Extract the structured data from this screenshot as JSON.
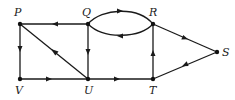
{
  "diagram": {
    "type": "directed-graph",
    "nodes": [
      {
        "id": "P",
        "label": "P",
        "x": 20,
        "y": 24,
        "lx": 14,
        "ly": 16
      },
      {
        "id": "Q",
        "label": "Q",
        "x": 88,
        "y": 24,
        "lx": 82,
        "ly": 16
      },
      {
        "id": "R",
        "label": "R",
        "x": 153,
        "y": 24,
        "lx": 149,
        "ly": 16
      },
      {
        "id": "S",
        "label": "S",
        "x": 217,
        "y": 52,
        "lx": 222,
        "ly": 56
      },
      {
        "id": "V",
        "label": "V",
        "x": 20,
        "y": 79,
        "lx": 15,
        "ly": 94
      },
      {
        "id": "U",
        "label": "U",
        "x": 88,
        "y": 79,
        "lx": 84,
        "ly": 94
      },
      {
        "id": "T",
        "label": "T",
        "x": 153,
        "y": 79,
        "lx": 149,
        "ly": 94
      }
    ],
    "edges": [
      {
        "from": "Q",
        "to": "P"
      },
      {
        "from": "P",
        "to": "V"
      },
      {
        "from": "U",
        "to": "P"
      },
      {
        "from": "Q",
        "to": "U"
      },
      {
        "from": "V",
        "to": "U"
      },
      {
        "from": "U",
        "to": "T"
      },
      {
        "from": "T",
        "to": "R"
      },
      {
        "from": "Q",
        "to": "R",
        "curve": "upper"
      },
      {
        "from": "R",
        "to": "Q",
        "curve": "lower"
      },
      {
        "from": "R",
        "to": "S"
      },
      {
        "from": "S",
        "to": "T"
      }
    ],
    "colors": {
      "stroke": "#1a1a1a",
      "background": "#ffffff"
    }
  }
}
